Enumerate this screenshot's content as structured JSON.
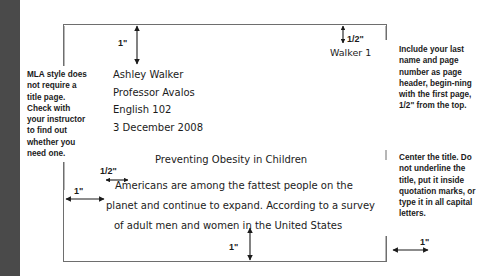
{
  "figure": {
    "kind": "mla-first-page-diagram"
  },
  "document": {
    "heading_lines": [
      "Ashley Walker",
      "Professor Avalos",
      "English 102",
      "3 December 2008"
    ],
    "title": "Preventing Obesity in Children",
    "body_lines": [
      "Americans are among the fattest people on the",
      "planet and continue to expand. According to a survey",
      "of adult men and women in the United States"
    ],
    "page_header": "Walker 1"
  },
  "annotations": {
    "left": "MLA style does not require a title page. Check with your instructor to find out whether you need one.",
    "right_top": "Include your last name and page number as page header, begin-ning with the first page, 1/2\" from the top.",
    "right_bottom": "Center the title. Do not underline the title, put it inside quotation marks, or type it in all capital letters."
  },
  "measurements": {
    "top_margin": "1\"",
    "header_offset": "1/2\"",
    "paragraph_indent": "1/2\"",
    "left_margin": "1\"",
    "bottom_margin": "1\"",
    "right_margin": "1\""
  },
  "colors": {
    "gutter_bar": "#4a4a4a",
    "page_border": "#6e6e6e",
    "ink": "#1b1b1b",
    "arrow": "#1b1b1b"
  }
}
